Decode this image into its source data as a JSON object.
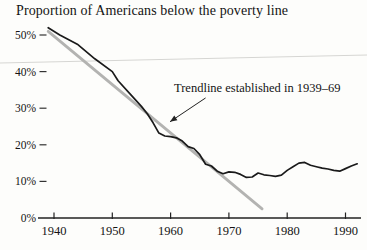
{
  "chart_data": {
    "type": "line",
    "title": "Proportion of Americans below the poverty line",
    "xlabel": "",
    "ylabel": "",
    "x_ticks": [
      1940,
      1950,
      1960,
      1970,
      1980,
      1990
    ],
    "y_ticks": [
      0,
      10,
      20,
      30,
      40,
      50
    ],
    "y_tick_suffix": "%",
    "xlim": [
      1938,
      1993
    ],
    "ylim": [
      0,
      53
    ],
    "grid": false,
    "colors": {
      "data_line": "#1a1a1a",
      "trendline": "#b3b3b1",
      "axis": "#222222",
      "text": "#141414",
      "artifact_line": "#d6d6d3"
    },
    "series": [
      {
        "name": "trendline-1939-69",
        "color": "#b3b3b1",
        "width": 2.8,
        "x": [
          1939,
          1975.7
        ],
        "y": [
          51,
          2.5
        ]
      },
      {
        "name": "poverty-rate",
        "color": "#1a1a1a",
        "width": 1.7,
        "x": [
          1939,
          1941,
          1944,
          1947,
          1950,
          1951,
          1953,
          1955,
          1956,
          1957,
          1958,
          1959,
          1960,
          1961,
          1962,
          1963,
          1964,
          1965,
          1966,
          1967,
          1968,
          1969,
          1970,
          1971,
          1972,
          1973,
          1974,
          1975,
          1976,
          1977,
          1978,
          1979,
          1980,
          1981,
          1982,
          1983,
          1984,
          1985,
          1986,
          1987,
          1988,
          1989,
          1990,
          1991,
          1992
        ],
        "y": [
          52,
          50,
          47.5,
          43.5,
          40,
          37.5,
          34,
          30.5,
          28.5,
          26,
          23.2,
          22.4,
          22.2,
          21.9,
          21.0,
          19.5,
          19.0,
          17.3,
          14.7,
          14.2,
          12.8,
          12.1,
          12.6,
          12.5,
          11.9,
          11.1,
          11.2,
          12.3,
          11.8,
          11.6,
          11.4,
          11.7,
          13.0,
          14.0,
          15.0,
          15.2,
          14.4,
          14.0,
          13.6,
          13.4,
          13.0,
          12.8,
          13.5,
          14.2,
          14.8
        ]
      }
    ],
    "annotation": {
      "text": "Trendline established in 1939–69",
      "arrow_from": {
        "year": 1966.0,
        "pct": 32.8
      },
      "arrow_to": {
        "year": 1959.9,
        "pct": 26.3
      }
    }
  }
}
